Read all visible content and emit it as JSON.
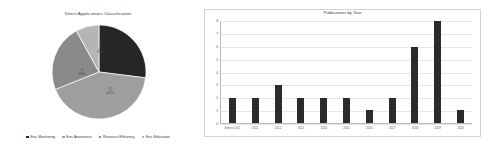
{
  "pie": {
    "title": "Direct Applications Classification",
    "labels": [
      {
        "count": "7",
        "percent": "27%"
      },
      {
        "count": "11",
        "percent": "42%"
      },
      {
        "count": "6",
        "percent": "23%"
      },
      {
        "count": "2",
        "percent": "8%"
      }
    ],
    "legend": [
      {
        "label": "Env. Monitoring",
        "color": "#262626"
      },
      {
        "label": "Env. Awareness",
        "color": "#9e9e9e"
      },
      {
        "label": "Resource Efficiency",
        "color": "#8a8a8a"
      },
      {
        "label": "Env. Education",
        "color": "#b5b5b5"
      }
    ]
  },
  "bar": {
    "title": "Publications by Year"
  },
  "chart_data": [
    {
      "type": "pie",
      "title": "Direct Applications Classification",
      "categories": [
        "Env. Monitoring",
        "Env. Awareness",
        "Resource Efficiency",
        "Env. Education"
      ],
      "values": [
        7,
        11,
        6,
        2
      ],
      "percentages": [
        27,
        42,
        23,
        8
      ],
      "colors": [
        "#262626",
        "#9e9e9e",
        "#8a8a8a",
        "#b5b5b5"
      ],
      "legend_position": "bottom",
      "total": 26
    },
    {
      "type": "bar",
      "title": "Publications by Year",
      "categories": [
        "before 2011",
        "2011",
        "2012",
        "2013",
        "2014",
        "2015",
        "2016",
        "2017",
        "2018",
        "2019",
        "2020"
      ],
      "values": [
        2,
        2,
        3,
        2,
        2,
        2,
        1,
        2,
        6,
        8,
        1
      ],
      "xlabel": "",
      "ylabel": "",
      "ylim": [
        0,
        8
      ],
      "yticks": [
        0,
        1,
        2,
        3,
        4,
        5,
        6,
        7,
        8
      ],
      "grid": true,
      "bar_color": "#2b2b2b"
    }
  ]
}
